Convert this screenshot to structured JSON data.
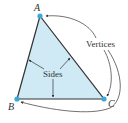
{
  "diagram": {
    "vertices": [
      {
        "label": "A",
        "x": 40,
        "y": 16
      },
      {
        "label": "B",
        "x": 17,
        "y": 99
      },
      {
        "label": "C",
        "x": 104,
        "y": 99
      }
    ],
    "labels": {
      "vertices_caption": "Vertices",
      "sides_caption": "Sides"
    },
    "colors": {
      "fill": "#cfe9f5",
      "edge": "#333333",
      "vertex_dot": "#3aa8dc",
      "arrow": "#333333"
    }
  }
}
